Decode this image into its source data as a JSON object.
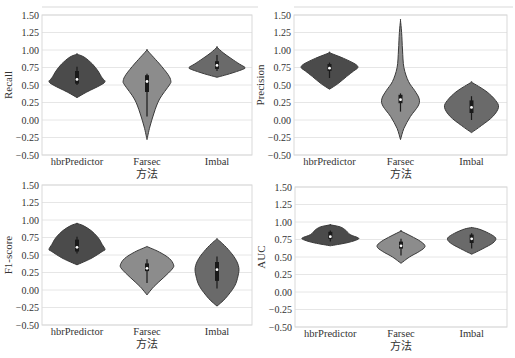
{
  "figure": {
    "width": 515,
    "height": 358,
    "grid_color": "#e6e6e6",
    "frame_color": "#d9d9d9",
    "violin_stroke": "#3a3a3a",
    "box_color": "#1a1a1a",
    "median_color": "#ffffff"
  },
  "chart_data": [
    {
      "type": "violin",
      "ylabel": "Recall",
      "xlabel": "方法",
      "categories": [
        "hbrPredictor",
        "Farsec",
        "Imbal"
      ],
      "yticks": [
        "1.50",
        "1.25",
        "1.00",
        "0.75",
        "0.50",
        "0.25",
        "0.00",
        "-0.25",
        "-0.50"
      ],
      "ylim": [
        -0.5,
        1.5
      ],
      "grid": true,
      "frame": {
        "x": 42,
        "y": 15,
        "w": 210,
        "h": 140,
        "top_line_y": 7
      },
      "series": [
        {
          "name": "hbrPredictor",
          "color": "#4b4b4b",
          "min": 0.32,
          "max": 0.94,
          "median": 0.58,
          "q1": 0.52,
          "q3": 0.7,
          "whisker_lo": 0.5,
          "whisker_hi": 0.76,
          "profile": [
            [
              0.32,
              0
            ],
            [
              0.4,
              0.35
            ],
            [
              0.5,
              0.85
            ],
            [
              0.55,
              1.0
            ],
            [
              0.6,
              0.9
            ],
            [
              0.7,
              0.75
            ],
            [
              0.8,
              0.55
            ],
            [
              0.9,
              0.25
            ],
            [
              0.94,
              0
            ]
          ]
        },
        {
          "name": "Farsec",
          "color": "#8c8c8c",
          "min": -0.28,
          "max": 1.0,
          "median": 0.55,
          "q1": 0.4,
          "q3": 0.64,
          "whisker_lo": 0.05,
          "whisker_hi": 0.66,
          "profile": [
            [
              -0.28,
              0
            ],
            [
              -0.1,
              0.1
            ],
            [
              0.1,
              0.25
            ],
            [
              0.3,
              0.45
            ],
            [
              0.5,
              0.8
            ],
            [
              0.56,
              0.85
            ],
            [
              0.65,
              0.75
            ],
            [
              0.8,
              0.45
            ],
            [
              0.92,
              0.18
            ],
            [
              1.0,
              0
            ]
          ]
        },
        {
          "name": "Imbal",
          "color": "#6a6a6a",
          "min": 0.61,
          "max": 1.04,
          "median": 0.78,
          "q1": 0.73,
          "q3": 0.84,
          "whisker_lo": 0.7,
          "whisker_hi": 0.93,
          "profile": [
            [
              0.61,
              0
            ],
            [
              0.66,
              0.45
            ],
            [
              0.72,
              0.9
            ],
            [
              0.75,
              1.0
            ],
            [
              0.8,
              0.8
            ],
            [
              0.88,
              0.5
            ],
            [
              0.96,
              0.22
            ],
            [
              1.04,
              0
            ]
          ]
        }
      ]
    },
    {
      "type": "violin",
      "ylabel": "Precision",
      "xlabel": "方法",
      "categories": [
        "hbrPredictor",
        "Farsec",
        "Imbal"
      ],
      "yticks": [
        "1.50",
        "1.25",
        "1.00",
        "0.75",
        "0.50",
        "0.25",
        "0.00",
        "-0.25",
        "-0.50"
      ],
      "ylim": [
        -0.5,
        1.5
      ],
      "grid": true,
      "frame": {
        "x": 294,
        "y": 15,
        "w": 213,
        "h": 140,
        "top_line_y": 7
      },
      "series": [
        {
          "name": "hbrPredictor",
          "color": "#4b4b4b",
          "min": 0.44,
          "max": 0.96,
          "median": 0.74,
          "q1": 0.7,
          "q3": 0.8,
          "whisker_lo": 0.6,
          "whisker_hi": 0.82,
          "profile": [
            [
              0.44,
              0
            ],
            [
              0.52,
              0.3
            ],
            [
              0.62,
              0.6
            ],
            [
              0.7,
              0.85
            ],
            [
              0.75,
              1.0
            ],
            [
              0.8,
              0.9
            ],
            [
              0.88,
              0.5
            ],
            [
              0.96,
              0
            ]
          ]
        },
        {
          "name": "Farsec",
          "color": "#8c8c8c",
          "min": -0.28,
          "max": 1.42,
          "median": 0.29,
          "q1": 0.24,
          "q3": 0.36,
          "whisker_lo": 0.12,
          "whisker_hi": 0.38,
          "profile": [
            [
              -0.28,
              0
            ],
            [
              -0.12,
              0.12
            ],
            [
              0.05,
              0.35
            ],
            [
              0.2,
              0.62
            ],
            [
              0.3,
              0.66
            ],
            [
              0.42,
              0.5
            ],
            [
              0.55,
              0.28
            ],
            [
              0.75,
              0.12
            ],
            [
              1.0,
              0.07
            ],
            [
              1.25,
              0.04
            ],
            [
              1.42,
              0
            ]
          ]
        },
        {
          "name": "Imbal",
          "color": "#6a6a6a",
          "min": -0.18,
          "max": 0.54,
          "median": 0.18,
          "q1": 0.1,
          "q3": 0.28,
          "whisker_lo": 0.0,
          "whisker_hi": 0.34,
          "profile": [
            [
              -0.18,
              0
            ],
            [
              -0.08,
              0.35
            ],
            [
              0.05,
              0.75
            ],
            [
              0.18,
              0.95
            ],
            [
              0.28,
              0.85
            ],
            [
              0.4,
              0.55
            ],
            [
              0.48,
              0.25
            ],
            [
              0.54,
              0
            ]
          ]
        }
      ]
    },
    {
      "type": "violin",
      "ylabel": "F1-score",
      "xlabel": "方法",
      "categories": [
        "hbrPredictor",
        "Farsec",
        "Imbal"
      ],
      "yticks": [
        "1.50",
        "1.25",
        "1.00",
        "0.75",
        "0.50",
        "0.25",
        "0.00",
        "-0.25",
        "-0.50"
      ],
      "ylim": [
        -0.5,
        1.5
      ],
      "grid": true,
      "frame": {
        "x": 42,
        "y": 185,
        "w": 210,
        "h": 140,
        "top_line_y": null
      },
      "series": [
        {
          "name": "hbrPredictor",
          "color": "#4b4b4b",
          "min": 0.36,
          "max": 0.95,
          "median": 0.61,
          "q1": 0.55,
          "q3": 0.72,
          "whisker_lo": 0.52,
          "whisker_hi": 0.76,
          "profile": [
            [
              0.36,
              0
            ],
            [
              0.45,
              0.5
            ],
            [
              0.55,
              0.9
            ],
            [
              0.58,
              1.0
            ],
            [
              0.65,
              0.9
            ],
            [
              0.75,
              0.75
            ],
            [
              0.85,
              0.5
            ],
            [
              0.92,
              0.22
            ],
            [
              0.95,
              0
            ]
          ]
        },
        {
          "name": "Farsec",
          "color": "#8c8c8c",
          "min": -0.07,
          "max": 0.62,
          "median": 0.31,
          "q1": 0.27,
          "q3": 0.38,
          "whisker_lo": 0.1,
          "whisker_hi": 0.44,
          "profile": [
            [
              -0.07,
              0
            ],
            [
              0.05,
              0.25
            ],
            [
              0.18,
              0.6
            ],
            [
              0.3,
              0.9
            ],
            [
              0.36,
              0.95
            ],
            [
              0.45,
              0.8
            ],
            [
              0.54,
              0.45
            ],
            [
              0.6,
              0.12
            ],
            [
              0.62,
              0
            ]
          ]
        },
        {
          "name": "Imbal",
          "color": "#6a6a6a",
          "min": -0.23,
          "max": 0.73,
          "median": 0.29,
          "q1": 0.13,
          "q3": 0.4,
          "whisker_lo": 0.02,
          "whisker_hi": 0.48,
          "profile": [
            [
              -0.23,
              0
            ],
            [
              -0.12,
              0.3
            ],
            [
              0.05,
              0.62
            ],
            [
              0.2,
              0.75
            ],
            [
              0.32,
              0.78
            ],
            [
              0.45,
              0.65
            ],
            [
              0.58,
              0.4
            ],
            [
              0.68,
              0.15
            ],
            [
              0.73,
              0
            ]
          ]
        }
      ]
    },
    {
      "type": "violin",
      "ylabel": "AUC",
      "xlabel": "方法",
      "categories": [
        "hbrPredictor",
        "Farsec",
        "Imbal"
      ],
      "yticks": [
        "1.50",
        "1.25",
        "1.00",
        "0.75",
        "0.50",
        "0.25",
        "0.00",
        "-0.25",
        "-0.50"
      ],
      "ylim": [
        -0.5,
        1.5
      ],
      "grid": true,
      "frame": {
        "x": 295,
        "y": 187,
        "w": 212,
        "h": 140,
        "top_line_y": null
      },
      "series": [
        {
          "name": "hbrPredictor",
          "color": "#4b4b4b",
          "min": 0.66,
          "max": 0.96,
          "median": 0.79,
          "q1": 0.76,
          "q3": 0.86,
          "whisker_lo": 0.72,
          "whisker_hi": 0.88,
          "profile": [
            [
              0.66,
              0
            ],
            [
              0.7,
              0.55
            ],
            [
              0.74,
              0.9
            ],
            [
              0.77,
              1.0
            ],
            [
              0.82,
              0.7
            ],
            [
              0.88,
              0.55
            ],
            [
              0.93,
              0.35
            ],
            [
              0.96,
              0
            ]
          ]
        },
        {
          "name": "Farsec",
          "color": "#8c8c8c",
          "min": 0.41,
          "max": 0.87,
          "median": 0.66,
          "q1": 0.62,
          "q3": 0.72,
          "whisker_lo": 0.52,
          "whisker_hi": 0.76,
          "profile": [
            [
              0.41,
              0
            ],
            [
              0.5,
              0.3
            ],
            [
              0.58,
              0.65
            ],
            [
              0.65,
              0.85
            ],
            [
              0.72,
              0.7
            ],
            [
              0.8,
              0.35
            ],
            [
              0.87,
              0
            ]
          ]
        },
        {
          "name": "Imbal",
          "color": "#6a6a6a",
          "min": 0.54,
          "max": 0.92,
          "median": 0.76,
          "q1": 0.7,
          "q3": 0.82,
          "whisker_lo": 0.62,
          "whisker_hi": 0.84,
          "profile": [
            [
              0.54,
              0
            ],
            [
              0.62,
              0.4
            ],
            [
              0.7,
              0.75
            ],
            [
              0.77,
              0.85
            ],
            [
              0.84,
              0.6
            ],
            [
              0.9,
              0.25
            ],
            [
              0.92,
              0
            ]
          ]
        }
      ]
    }
  ]
}
